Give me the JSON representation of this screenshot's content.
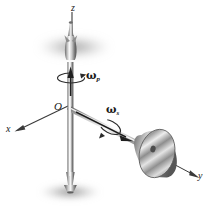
{
  "figure": {
    "background_color": "#ffffff",
    "ink_color": "#1a1a1a",
    "metal_light": "#f2f2f2",
    "metal_mid": "#9a9a9a",
    "metal_dark": "#4a4a4a",
    "shadow_color": "#8a8a8a"
  },
  "axes": {
    "z": {
      "label": "z",
      "x": 71,
      "y": 3
    },
    "x": {
      "label": "x",
      "x": 6,
      "y": 124
    },
    "y": {
      "label": "y",
      "x": 198,
      "y": 171
    },
    "origin": {
      "label": "O",
      "x": 54,
      "y": 101
    }
  },
  "annotations": {
    "precession": {
      "symbol": "ω",
      "subscript": "p",
      "name": "precession-angular-velocity",
      "x": 86,
      "y": 70
    },
    "spin": {
      "symbol": "ω",
      "subscript": "s",
      "name": "spin-angular-velocity",
      "x": 106,
      "y": 104
    }
  },
  "parts": {
    "spindle": "vertical-spindle",
    "flywheel": "flywheel-disk",
    "shaft": "horizontal-shaft",
    "top_shadow": "top-blur-shadow",
    "bottom_shadow": "bottom-blur-shadow"
  }
}
